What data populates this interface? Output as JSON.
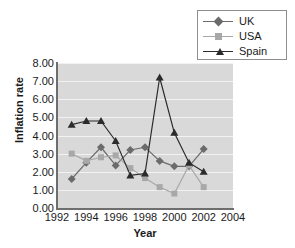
{
  "chart_data": {
    "type": "line",
    "title": "",
    "xlabel": "Year",
    "ylabel": "Inflation rate",
    "x": [
      1993,
      1994,
      1995,
      1996,
      1997,
      1998,
      1999,
      2000,
      2001,
      2002
    ],
    "xlim": [
      1992,
      2004
    ],
    "ylim": [
      0.0,
      8.0
    ],
    "xticks": [
      "1992",
      "1994",
      "1996",
      "1998",
      "2000",
      "2002",
      "2004"
    ],
    "xtick_values": [
      1992,
      1994,
      1996,
      1998,
      2000,
      2002,
      2004
    ],
    "yticks": [
      "0.00",
      "1.00",
      "2.00",
      "3.00",
      "4.00",
      "5.00",
      "6.00",
      "7.00",
      "8.00"
    ],
    "ytick_values": [
      0,
      1,
      2,
      3,
      4,
      5,
      6,
      7,
      8
    ],
    "grid": true,
    "grid_axis": "y",
    "legend_position": "top-right",
    "plot_background": "#d9d9d9",
    "series": [
      {
        "name": "UK",
        "marker": "diamond",
        "color": "#6b6b6b",
        "values": [
          1.6,
          2.5,
          3.35,
          2.35,
          3.2,
          3.35,
          2.6,
          2.3,
          2.3,
          3.25
        ]
      },
      {
        "name": "USA",
        "marker": "square",
        "color": "#a8a8a8",
        "values": [
          3.0,
          2.6,
          2.8,
          2.9,
          2.2,
          1.65,
          1.15,
          0.8,
          2.35,
          1.15
        ]
      },
      {
        "name": "Spain",
        "marker": "triangle",
        "color": "#2b2b2b",
        "values": [
          4.6,
          4.8,
          4.8,
          3.7,
          1.8,
          1.9,
          7.2,
          4.15,
          2.5,
          2.0
        ]
      }
    ]
  },
  "legend": {
    "items": [
      {
        "label": "UK"
      },
      {
        "label": "USA"
      },
      {
        "label": "Spain"
      }
    ]
  },
  "axes": {
    "x_title": "Year",
    "y_title": "Inflation rate"
  }
}
